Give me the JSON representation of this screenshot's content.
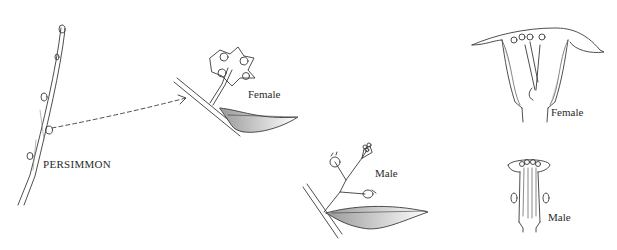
{
  "figure": {
    "labels": {
      "twig": "PERSIMMON",
      "female_branch": "Female",
      "male_branch": "Male",
      "female_section": "Female",
      "male_section": "Male"
    },
    "colors": {
      "ink": "#3a3a3a",
      "shade": "#bdbdbd",
      "background": "#ffffff"
    }
  }
}
